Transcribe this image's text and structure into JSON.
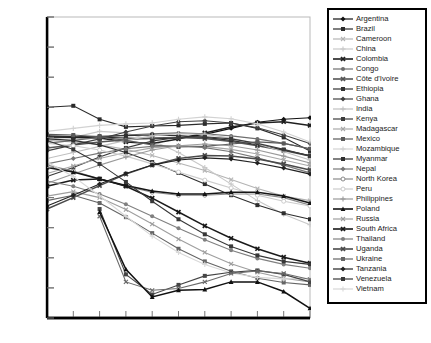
{
  "chart_data": {
    "type": "line",
    "title": "",
    "xlabel": "Year",
    "ylabel": "Percentage of population",
    "xlim": [
      2000,
      2050
    ],
    "ylim": [
      0.04,
      0.14
    ],
    "ytick_labels": [
      "0.04",
      "0.05",
      "0.06",
      "0.07",
      "0.08",
      "0.09",
      "0.10",
      "0.11",
      "0.12",
      "0.13",
      "0.14"
    ],
    "ytick_values": [
      0.04,
      0.05,
      0.06,
      0.07,
      0.08,
      0.09,
      0.1,
      0.11,
      0.12,
      0.13,
      0.14
    ],
    "x": [
      2000,
      2005,
      2010,
      2015,
      2020,
      2025,
      2030,
      2035,
      2040,
      2045,
      2050
    ],
    "xtick_labels": [
      "2000",
      "2005",
      "2010",
      "2015",
      "2020",
      "2025",
      "2030",
      "2035",
      "2040",
      "2045",
      "2050"
    ],
    "grid": false,
    "legend_position": "right-outside",
    "series": [
      {
        "name": "Argentina",
        "marker": "diamond",
        "color": "#111111",
        "values": [
          0.1005,
          0.1003,
          0.1,
          0.0998,
          0.0995,
          0.0998,
          0.101,
          0.103,
          0.105,
          0.106,
          0.1065
        ]
      },
      {
        "name": "Brazil",
        "marker": "square",
        "color": "#2b2b2b",
        "values": [
          0.11,
          0.1105,
          0.106,
          0.1035,
          0.1038,
          0.104,
          0.1045,
          0.1048,
          0.103,
          0.1,
          0.0955
        ]
      },
      {
        "name": "Cameroon",
        "marker": "x",
        "color": "#b4b4b4",
        "values": [
          0.099,
          0.0985,
          0.0975,
          0.096,
          0.094,
          0.0915,
          0.089,
          0.086,
          0.083,
          0.0805,
          0.079
        ]
      },
      {
        "name": "China",
        "marker": "plus",
        "color": "#c8c8c8",
        "values": [
          0.0995,
          0.1,
          0.102,
          0.1015,
          0.099,
          0.095,
          0.09,
          0.0845,
          0.079,
          0.0745,
          0.071
        ]
      },
      {
        "name": "Colombia",
        "marker": "x-thick",
        "color": "#1f1f1f",
        "values": [
          0.1002,
          0.1,
          0.0998,
          0.0985,
          0.098,
          0.0995,
          0.1015,
          0.1035,
          0.1048,
          0.1052,
          0.104
        ]
      },
      {
        "name": "Congo",
        "marker": "circle",
        "color": "#6e6e6e",
        "values": [
          0.098,
          0.099,
          0.1,
          0.1008,
          0.1012,
          0.1015,
          0.1012,
          0.1005,
          0.0995,
          0.098,
          0.0962
        ]
      },
      {
        "name": "Côte d'Ivoire",
        "marker": "x-thick",
        "color": "#555555",
        "values": [
          0.0965,
          0.0975,
          0.0985,
          0.0992,
          0.0998,
          0.1,
          0.0996,
          0.0986,
          0.0972,
          0.0956,
          0.0938
        ]
      },
      {
        "name": "Ethiopia",
        "marker": "square",
        "color": "#303030",
        "values": [
          0.1,
          0.1002,
          0.1004,
          0.1006,
          0.1008,
          0.1006,
          0.1,
          0.099,
          0.0975,
          0.0958,
          0.094
        ]
      },
      {
        "name": "Ghana",
        "marker": "diamond",
        "color": "#404040",
        "values": [
          0.0955,
          0.0975,
          0.0995,
          0.1018,
          0.1038,
          0.1052,
          0.1055,
          0.1048,
          0.1032,
          0.1008,
          0.098
        ]
      },
      {
        "name": "India",
        "marker": "plus",
        "color": "#c0c0c0",
        "values": [
          0.093,
          0.095,
          0.097,
          0.099,
          0.1005,
          0.1012,
          0.101,
          0.0998,
          0.0978,
          0.0952,
          0.0925
        ]
      },
      {
        "name": "Kenya",
        "marker": "square",
        "color": "#3a3a3a",
        "values": [
          0.087,
          0.09,
          0.0935,
          0.0965,
          0.0988,
          0.1,
          0.1002,
          0.0995,
          0.098,
          0.096,
          0.0938
        ]
      },
      {
        "name": "Madagascar",
        "marker": "x",
        "color": "#a8a8a8",
        "values": [
          0.088,
          0.0905,
          0.093,
          0.095,
          0.0965,
          0.0972,
          0.097,
          0.096,
          0.0945,
          0.0925,
          0.0905
        ]
      },
      {
        "name": "Mexico",
        "marker": "square",
        "color": "#5a5a5a",
        "values": [
          0.101,
          0.1008,
          0.1002,
          0.099,
          0.0975,
          0.0968,
          0.097,
          0.0978,
          0.0985,
          0.098,
          0.0962
        ]
      },
      {
        "name": "Mozambique",
        "marker": "plus",
        "color": "#d2d2d2",
        "values": [
          0.102,
          0.103,
          0.104,
          0.1045,
          0.1048,
          0.106,
          0.1068,
          0.1062,
          0.1045,
          0.1018,
          0.0985
        ]
      },
      {
        "name": "Myanmar",
        "marker": "square",
        "color": "#2e2e2e",
        "values": [
          0.0995,
          0.099,
          0.0975,
          0.095,
          0.0918,
          0.0882,
          0.0845,
          0.0808,
          0.0775,
          0.0748,
          0.0728
        ]
      },
      {
        "name": "Nepal",
        "marker": "diamond",
        "color": "#787878",
        "values": [
          0.0912,
          0.093,
          0.0948,
          0.0962,
          0.097,
          0.0972,
          0.0966,
          0.0952,
          0.0932,
          0.0908,
          0.0882
        ]
      },
      {
        "name": "North Korea",
        "marker": "circle-open",
        "color": "#8a8a8a",
        "values": [
          0.0908,
          0.0888,
          0.0862,
          0.0838,
          0.0818,
          0.0808,
          0.0808,
          0.0812,
          0.0812,
          0.08,
          0.0775
        ]
      },
      {
        "name": "Peru",
        "marker": "circle-open",
        "color": "#cccccc",
        "values": [
          0.098,
          0.0972,
          0.0958,
          0.0938,
          0.0912,
          0.0885,
          0.0858,
          0.0832,
          0.0808,
          0.0788,
          0.0772
        ]
      },
      {
        "name": "Philippines",
        "marker": "plus",
        "color": "#9a9a9a",
        "values": [
          0.0848,
          0.0878,
          0.0908,
          0.0935,
          0.0958,
          0.0972,
          0.0978,
          0.0972,
          0.0958,
          0.0938,
          0.0915
        ]
      },
      {
        "name": "Poland",
        "marker": "triangle",
        "color": "#151515",
        "values": [
          0.09,
          0.0885,
          0.0862,
          0.084,
          0.0822,
          0.0812,
          0.0812,
          0.0818,
          0.0818,
          0.0805,
          0.0782
        ]
      },
      {
        "name": "Russia",
        "marker": "x",
        "color": "#9e9e9e",
        "values": [
          0.0805,
          0.082,
          0.08,
          0.076,
          0.0712,
          0.0662,
          0.0618,
          0.058,
          0.0552,
          0.0532,
          0.052
        ]
      },
      {
        "name": "South Africa",
        "marker": "x-thick",
        "color": "#1a1a1a",
        "values": [
          0.0838,
          0.0858,
          0.0862,
          0.0838,
          0.0798,
          0.0752,
          0.0706,
          0.0665,
          0.063,
          0.0602,
          0.0582
        ]
      },
      {
        "name": "Thailand",
        "marker": "circle",
        "color": "#808080",
        "values": [
          0.0855,
          0.0838,
          0.0812,
          0.0778,
          0.0738,
          0.0698,
          0.066,
          0.0625,
          0.0598,
          0.0578,
          0.0565
        ]
      },
      {
        "name": "Uganda",
        "marker": "x-thick",
        "color": "#4a4a4a",
        "values": [
          0.0762,
          0.08,
          0.084,
          0.0878,
          0.0908,
          0.093,
          0.094,
          0.0938,
          0.0928,
          0.0912,
          0.0892
        ]
      },
      {
        "name": "Ukraine",
        "marker": "square",
        "color": "#656565",
        "values": [
          0.079,
          0.0808,
          0.0782,
          0.0735,
          0.0682,
          0.063,
          0.0588,
          0.0555,
          0.0532,
          0.0518,
          0.051
        ]
      },
      {
        "name": "Tanzania",
        "marker": "diamond",
        "color": "#222222",
        "values": [
          0.0772,
          0.0808,
          0.0845,
          0.088,
          0.0908,
          0.0925,
          0.0932,
          0.0928,
          0.0915,
          0.0898,
          0.0878
        ]
      },
      {
        "name": "Venezuela",
        "marker": "square",
        "color": "#383838",
        "values": [
          0.099,
          0.096,
          0.0912,
          0.0852,
          0.0788,
          0.0728,
          0.0678,
          0.0638,
          0.0608,
          0.0588,
          0.0578
        ]
      },
      {
        "name": "Vietnam",
        "marker": "plus",
        "color": "#d8d8d8",
        "values": [
          0.0918,
          0.087,
          0.0806,
          0.0738,
          0.0672,
          0.0618,
          0.0578,
          0.055,
          0.0535,
          0.053,
          0.0532
        ]
      }
    ],
    "special_low_series": [
      {
        "name": "low-a",
        "color": "#454545",
        "marker": "square",
        "values": [
          null,
          null,
          0.0762,
          0.0545,
          0.0478,
          0.051,
          0.054,
          0.0552,
          0.0558,
          0.0545,
          0.052
        ]
      },
      {
        "name": "low-b",
        "color": "#6a6a6a",
        "marker": "x",
        "values": [
          null,
          null,
          0.0738,
          0.052,
          0.0492,
          0.0498,
          0.052,
          0.0548,
          0.0556,
          0.0548,
          0.0528
        ]
      },
      {
        "name": "low-c",
        "color": "#111111",
        "marker": "triangle",
        "values": [
          null,
          null,
          0.0752,
          0.0562,
          0.047,
          0.0492,
          0.0495,
          0.052,
          0.052,
          0.0488,
          0.0432
        ]
      }
    ]
  },
  "legend": {
    "items": [
      {
        "label": "Argentina"
      },
      {
        "label": "Brazil"
      },
      {
        "label": "Cameroon"
      },
      {
        "label": "China"
      },
      {
        "label": "Colombia"
      },
      {
        "label": "Congo"
      },
      {
        "label": "Côte d'Ivoire"
      },
      {
        "label": "Ethiopia"
      },
      {
        "label": "Ghana"
      },
      {
        "label": "India"
      },
      {
        "label": "Kenya"
      },
      {
        "label": "Madagascar"
      },
      {
        "label": "Mexico"
      },
      {
        "label": "Mozambique"
      },
      {
        "label": "Myanmar"
      },
      {
        "label": "Nepal"
      },
      {
        "label": "North Korea"
      },
      {
        "label": "Peru"
      },
      {
        "label": "Philippines"
      },
      {
        "label": "Poland"
      },
      {
        "label": "Russia"
      },
      {
        "label": "South Africa"
      },
      {
        "label": "Thailand"
      },
      {
        "label": "Uganda"
      },
      {
        "label": "Ukraine"
      },
      {
        "label": "Tanzania"
      },
      {
        "label": "Venezuela"
      },
      {
        "label": "Vietnam"
      }
    ]
  }
}
